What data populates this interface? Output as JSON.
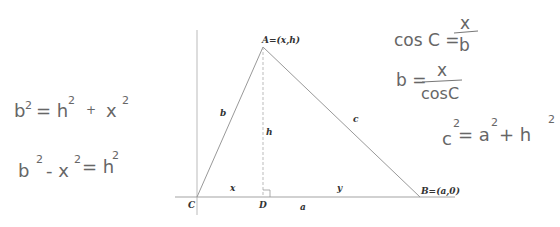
{
  "diagram": {
    "type": "triangle-with-altitude",
    "vertices": {
      "A": {
        "label": "A=(x,h)"
      },
      "B": {
        "label": "B=(a,0)"
      },
      "C": {
        "label": "C"
      },
      "D": {
        "label": "D"
      }
    },
    "side_labels": {
      "b": "b",
      "c": "c",
      "h": "h",
      "x": "x",
      "y": "y",
      "a": "a"
    },
    "line_color": "#999999",
    "dashed_color": "#aaaaaa"
  },
  "handwritten": {
    "left": {
      "eq1": {
        "lhs": "b",
        "lhs_exp": "2",
        "mid": "= h",
        "mid_exp": "2",
        "plus": "+",
        "rhs": "x",
        "rhs_exp": "2"
      },
      "eq2": {
        "t1": "b",
        "t1_exp": "2",
        "minus": "- x",
        "t2_exp": "2",
        "eq": "= h",
        "t3_exp": "2"
      }
    },
    "right": {
      "eq1": {
        "lhs": "cos C =",
        "num": "x",
        "den": "b"
      },
      "eq2": {
        "lhs": "b =",
        "num": "x",
        "den": "cosC"
      },
      "eq3": {
        "t1": "c",
        "t1_exp": "2",
        "eq": "= a",
        "t2_exp": "2",
        "plus": "+ h",
        "t3_exp": "2"
      }
    }
  }
}
